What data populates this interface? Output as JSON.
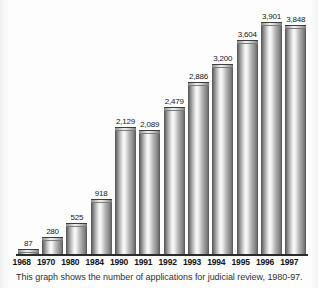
{
  "chart_data": {
    "type": "bar",
    "title": "",
    "subtitle": "",
    "xlabel": "",
    "ylabel": "",
    "grid": false,
    "legend": false,
    "ylim": [
      0,
      4000
    ],
    "categories": [
      "1968",
      "1970",
      "1980",
      "1984",
      "1990",
      "1991",
      "1992",
      "1993",
      "1994",
      "1995",
      "1996",
      "1997"
    ],
    "x": [
      "1968",
      "1970",
      "1980",
      "1984",
      "1990",
      "1991",
      "1992",
      "1993",
      "1994",
      "1995",
      "1996",
      "1997"
    ],
    "values": [
      87,
      280,
      525,
      918,
      2129,
      2089,
      2479,
      2886,
      3200,
      3604,
      3901,
      3848
    ],
    "data_labels": [
      "87",
      "280",
      "525",
      "918",
      "2,129",
      "2,089",
      "2,479",
      "2,886",
      "3,200",
      "3,604",
      "3,901",
      "3,848"
    ],
    "bars": [
      {
        "category": "1968",
        "value": 87,
        "label": "87"
      },
      {
        "category": "1970",
        "value": 280,
        "label": "280"
      },
      {
        "category": "1980",
        "value": 525,
        "label": "525"
      },
      {
        "category": "1984",
        "value": 918,
        "label": "918"
      },
      {
        "category": "1990",
        "value": 2129,
        "label": "2,129"
      },
      {
        "category": "1991",
        "value": 2089,
        "label": "2,089"
      },
      {
        "category": "1992",
        "value": 2479,
        "label": "2,479"
      },
      {
        "category": "1993",
        "value": 2886,
        "label": "2,886"
      },
      {
        "category": "1994",
        "value": 3200,
        "label": "3,200"
      },
      {
        "category": "1995",
        "value": 3604,
        "label": "3,604"
      },
      {
        "category": "1996",
        "value": 3901,
        "label": "3,901"
      },
      {
        "category": "1997",
        "value": 3848,
        "label": "3,848"
      }
    ],
    "annotations": [
      "This graph shows the number of applications for judicial review, 1980-97."
    ]
  },
  "caption": {
    "text": "This graph shows the number of applications for judicial review, 1980-97."
  },
  "colors": {
    "bar_dark": "#4f4f4f",
    "bar_highlight": "#fbfbfb",
    "axis": "#2b2b2b",
    "label_text": "#15181c",
    "caption_text": "#2e3338",
    "background": "#fdfdfd"
  }
}
